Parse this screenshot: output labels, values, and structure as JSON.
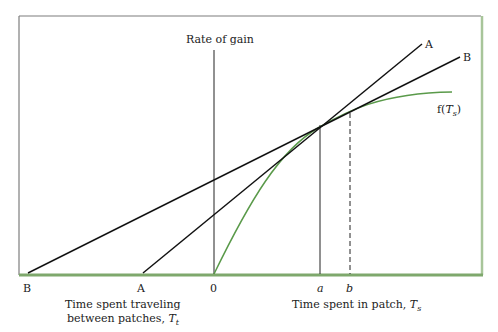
{
  "diagram": {
    "y_axis_label": "Rate of gain",
    "origin_label": "0",
    "x_left_label_line1": "Time spent traveling",
    "x_left_label_line2": "between patches, ",
    "x_left_var": "T",
    "x_left_sub": "t",
    "x_right_label": "Time spent in patch, ",
    "x_right_var": "T",
    "x_right_sub": "s",
    "travel_points": [
      {
        "label": "B",
        "x": 28
      },
      {
        "label": "A",
        "x": 143
      }
    ],
    "patch_points": [
      {
        "label": "a",
        "x": 320,
        "style": "solid"
      },
      {
        "label": "b",
        "x": 350,
        "style": "dashed"
      }
    ],
    "lines": [
      {
        "label": "A",
        "from": [
          143,
          273
        ],
        "to": [
          422,
          44
        ]
      },
      {
        "label": "B",
        "from": [
          28,
          273
        ],
        "to": [
          460,
          57
        ]
      }
    ],
    "curve": {
      "label_prefix": "f(",
      "label_var": "T",
      "label_sub": "s",
      "label_suffix": ")",
      "color": "#5a9a4a"
    },
    "colors": {
      "frame": "#7d7d7d",
      "frame_accent": "#8fb37e",
      "curve": "#5a9a4a",
      "lines": "#111111"
    }
  }
}
